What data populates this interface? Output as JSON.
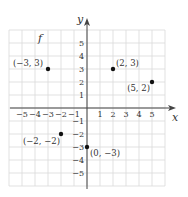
{
  "chart_data": {
    "type": "scatter",
    "title": "f",
    "xlabel": "x",
    "ylabel": "y",
    "xlim": [
      -6,
      6
    ],
    "ylim": [
      -6,
      6
    ],
    "grid": true,
    "x_ticks": [
      -5,
      -4,
      -3,
      -2,
      -1,
      1,
      2,
      3,
      4,
      5
    ],
    "y_ticks": [
      5,
      4,
      3,
      2,
      1,
      -1,
      -2,
      -3,
      -4,
      -5
    ],
    "x_tick_labels": [
      "−5",
      "−4",
      "−3",
      "−2",
      "−1",
      "1",
      "2",
      "3",
      "4",
      "5"
    ],
    "y_tick_labels": [
      "5",
      "4",
      "3",
      "2",
      "1",
      "−1",
      "−2",
      "−3",
      "−4",
      "−5"
    ],
    "series": [
      {
        "name": "f",
        "points": [
          {
            "x": -3,
            "y": 3,
            "label": "(−3, 3)"
          },
          {
            "x": 2,
            "y": 3,
            "label": "(2, 3)"
          },
          {
            "x": 5,
            "y": 2,
            "label": "(5, 2)"
          },
          {
            "x": -2,
            "y": -2,
            "label": "(−2, −2)"
          },
          {
            "x": 0,
            "y": -3,
            "label": "(0, −3)"
          }
        ]
      }
    ],
    "colors": {
      "grid": "#d9d9d9",
      "axis": "#444444",
      "point": "#111111"
    }
  }
}
